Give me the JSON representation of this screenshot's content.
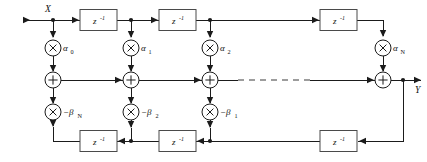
{
  "diagram": {
    "input_label": "X",
    "output_label": "Y",
    "delay_label": "z",
    "delay_exponent": "-1",
    "multiply_symbol": "×",
    "add_symbol": "+",
    "colors": {
      "wire": "#1b1b1b",
      "box_stroke": "#4a4a4a",
      "background": "#ffffff",
      "text": "#111111",
      "dashed_wire": "#3a3a3a"
    },
    "feedforward": {
      "row_label": "feedforward-delay-line",
      "delays": [
        {
          "name": "ff-delay-1",
          "label": "z",
          "exponent": "-1"
        },
        {
          "name": "ff-delay-2",
          "label": "z",
          "exponent": "-1"
        },
        {
          "name": "ff-delay-n",
          "label": "z",
          "exponent": "-1"
        }
      ]
    },
    "feedback": {
      "row_label": "feedback-delay-line",
      "delays": [
        {
          "name": "fb-delay-1",
          "label": "z",
          "exponent": "-1"
        },
        {
          "name": "fb-delay-2",
          "label": "z",
          "exponent": "-1"
        },
        {
          "name": "fb-delay-n",
          "label": "z",
          "exponent": "-1"
        }
      ]
    },
    "numerator_coefficients": [
      {
        "name": "alpha-0",
        "symbol": "α",
        "subscript": "0"
      },
      {
        "name": "alpha-1",
        "symbol": "α",
        "subscript": "1"
      },
      {
        "name": "alpha-2",
        "symbol": "α",
        "subscript": "2"
      },
      {
        "name": "alpha-n",
        "symbol": "α",
        "subscript": "N"
      }
    ],
    "denominator_coefficients": [
      {
        "name": "beta-n",
        "symbol": "−β",
        "subscript": "N"
      },
      {
        "name": "beta-2",
        "symbol": "−β",
        "subscript": "2"
      },
      {
        "name": "beta-1",
        "symbol": "−β",
        "subscript": "1"
      }
    ],
    "adders": [
      {
        "name": "adder-0",
        "symbol": "+"
      },
      {
        "name": "adder-1",
        "symbol": "+"
      },
      {
        "name": "adder-2",
        "symbol": "+"
      },
      {
        "name": "adder-n",
        "symbol": "+"
      }
    ],
    "ellipsis": {
      "name": "continuation-dashes",
      "present": true
    }
  }
}
